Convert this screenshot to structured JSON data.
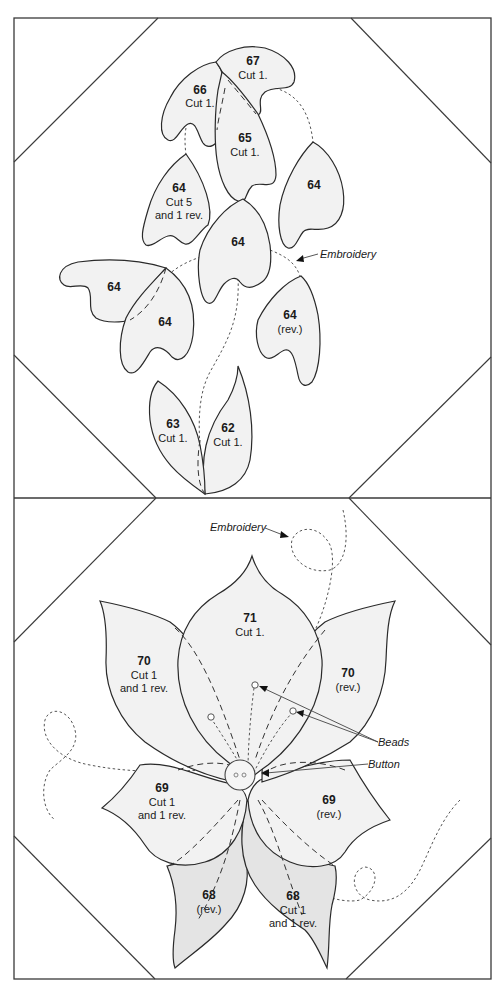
{
  "diagram": {
    "colors": {
      "outline": "#2a2a2a",
      "fill_light": "#f2f2f2",
      "fill_dark": "#e4e4e4",
      "background": "#ffffff"
    },
    "top_block": {
      "pieces": [
        {
          "id": "67",
          "number": "67",
          "note": "Cut 1."
        },
        {
          "id": "66",
          "number": "66",
          "note": "Cut 1."
        },
        {
          "id": "65",
          "number": "65",
          "note": "Cut 1."
        },
        {
          "id": "64a",
          "number": "64",
          "note": "Cut 5",
          "note2": "and 1 rev."
        },
        {
          "id": "64b",
          "number": "64",
          "note": ""
        },
        {
          "id": "64c",
          "number": "64",
          "note": ""
        },
        {
          "id": "64d",
          "number": "64",
          "note": ""
        },
        {
          "id": "64e",
          "number": "64",
          "note": ""
        },
        {
          "id": "64f",
          "number": "64",
          "note": "(rev.)"
        },
        {
          "id": "63",
          "number": "63",
          "note": "Cut 1."
        },
        {
          "id": "62",
          "number": "62",
          "note": "Cut 1."
        }
      ],
      "callouts": {
        "embroidery": "Embroidery"
      }
    },
    "bottom_block": {
      "pieces": [
        {
          "id": "71",
          "number": "71",
          "note": "Cut 1."
        },
        {
          "id": "70l",
          "number": "70",
          "note": "Cut 1",
          "note2": "and 1 rev."
        },
        {
          "id": "70r",
          "number": "70",
          "note": "(rev.)"
        },
        {
          "id": "69l",
          "number": "69",
          "note": "Cut 1",
          "note2": "and 1 rev."
        },
        {
          "id": "69r",
          "number": "69",
          "note": "(rev.)"
        },
        {
          "id": "68l",
          "number": "68",
          "note": "(rev.)"
        },
        {
          "id": "68r",
          "number": "68",
          "note": "Cut 1",
          "note2": "and 1 rev."
        }
      ],
      "callouts": {
        "embroidery": "Embroidery",
        "beads": "Beads",
        "button": "Button"
      }
    }
  }
}
